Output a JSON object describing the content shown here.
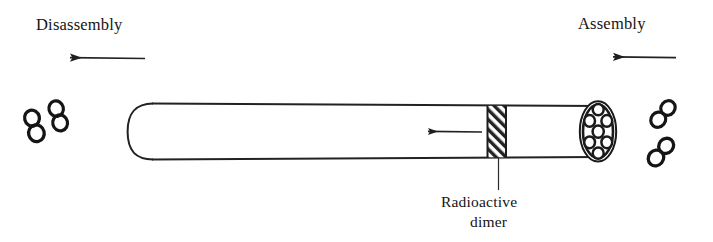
{
  "figure": {
    "type": "scientific-diagram",
    "background_color": "#ffffff",
    "ink_color": "#1a1a1a"
  },
  "labels": {
    "disassembly": "Disassembly",
    "assembly": "Assembly",
    "caption_line1": "Radioactive",
    "caption_line2": "dimer"
  },
  "arrows": {
    "disassembly_arrow": {
      "direction": "left",
      "x_start": 145,
      "x_end": 57,
      "y": 58
    },
    "assembly_arrow": {
      "direction": "left",
      "x_start": 676,
      "x_end": 600,
      "y": 57
    },
    "internal_arrow": {
      "direction": "left",
      "x_start": 482,
      "x_end": 416,
      "y": 132
    }
  },
  "cylinder": {
    "left_x": 128,
    "right_x": 601,
    "top_y": 104,
    "bottom_y": 158,
    "left_cap_rounded": true,
    "right_cap_ellipse": true
  },
  "hatched_band": {
    "x_left": 487,
    "x_right": 506,
    "hatch_angle_deg": 45,
    "label_leader_x": 499,
    "label_leader_y_top": 158,
    "label_leader_y_bottom": 190
  },
  "end_cap": {
    "center_x": 598,
    "center_y": 131,
    "radius_x": 17,
    "radius_y": 30,
    "protofilament_count": 7
  },
  "dimers": {
    "left_group": [
      {
        "cx": 34,
        "cy": 126,
        "angle": -15
      },
      {
        "cx": 57,
        "cy": 117,
        "angle": -15
      }
    ],
    "right_group": [
      {
        "cx": 663,
        "cy": 114,
        "angle": 38
      },
      {
        "cx": 661,
        "cy": 152,
        "angle": 38
      }
    ]
  }
}
